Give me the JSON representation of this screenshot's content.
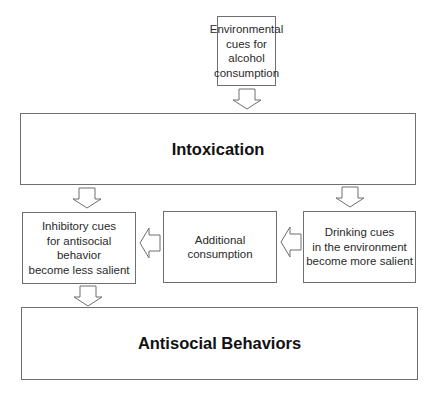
{
  "diagram": {
    "type": "flowchart",
    "nodes": {
      "env_cues": {
        "label": "Environmental cues for alcohol consumption",
        "lines": [
          "Environmental",
          "cues for alcohol",
          "consumption"
        ]
      },
      "intoxication": {
        "label": "Intoxication"
      },
      "inhibitory": {
        "label": "Inhibitory cues for antisocial behavior become less salient",
        "lines": [
          "Inhibitory cues",
          "for antisocial",
          "behavior",
          "become less salient"
        ]
      },
      "additional": {
        "label": "Additional consumption",
        "lines": [
          "Additional",
          "consumption"
        ]
      },
      "drinking_cues": {
        "label": "Drinking cues in the environment become more salient",
        "lines": [
          "Drinking cues",
          "in the environment",
          "become more salient"
        ]
      },
      "antisocial": {
        "label": "Antisocial Behaviors"
      }
    },
    "edges": [
      {
        "from": "env_cues",
        "to": "intoxication",
        "direction": "down",
        "style": "hollow-block-arrow"
      },
      {
        "from": "intoxication",
        "to": "inhibitory",
        "direction": "down",
        "style": "hollow-block-arrow"
      },
      {
        "from": "intoxication",
        "to": "drinking_cues",
        "direction": "down",
        "style": "hollow-block-arrow"
      },
      {
        "from": "drinking_cues",
        "to": "additional",
        "direction": "left",
        "style": "hollow-block-arrow"
      },
      {
        "from": "additional",
        "to": "inhibitory",
        "direction": "left",
        "style": "hollow-block-arrow"
      },
      {
        "from": "inhibitory",
        "to": "antisocial",
        "direction": "down",
        "style": "hollow-block-arrow"
      }
    ],
    "colors": {
      "border": "#6f6f6f",
      "text": "#1a1a1a",
      "background": "#ffffff"
    }
  }
}
